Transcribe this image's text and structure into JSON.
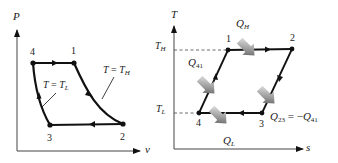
{
  "left_diagram": {
    "title": "P-v diagram",
    "y_axis_label": "P",
    "x_axis_label": "v",
    "points": [
      {
        "id": "4",
        "label": "4"
      },
      {
        "id": "1",
        "label": "1"
      },
      {
        "id": "2",
        "label": "2"
      },
      {
        "id": "3",
        "label": "3"
      }
    ],
    "annotations": {
      "isotherm_high": {
        "var": "T",
        "eq": " = ",
        "rhs": "T",
        "sub": "H"
      },
      "isotherm_low": {
        "var": "T",
        "eq": " = ",
        "rhs": "T",
        "sub": "L"
      }
    }
  },
  "right_diagram": {
    "title": "T-s diagram",
    "y_axis_label": "T",
    "x_axis_label": "s",
    "tick_labels": {
      "high": {
        "main": "T",
        "sub": "H"
      },
      "low": {
        "main": "T",
        "sub": "L"
      }
    },
    "points": [
      {
        "id": "1",
        "label": "1"
      },
      {
        "id": "2",
        "label": "2"
      },
      {
        "id": "3",
        "label": "3"
      },
      {
        "id": "4",
        "label": "4"
      }
    ],
    "heat_labels": {
      "q_h": {
        "main": "Q",
        "sub": "H"
      },
      "q_l": {
        "main": "Q",
        "sub": "L"
      },
      "q_41": {
        "main": "Q",
        "sub": "41"
      },
      "q_23": {
        "main": "Q",
        "sub": "23",
        "eq": " = −",
        "rhs_main": "Q",
        "rhs_sub": "41"
      }
    },
    "colors": {
      "line": "#111111",
      "heat_arrow_light": "#e6e6e6",
      "heat_arrow_dark": "#555555"
    }
  }
}
